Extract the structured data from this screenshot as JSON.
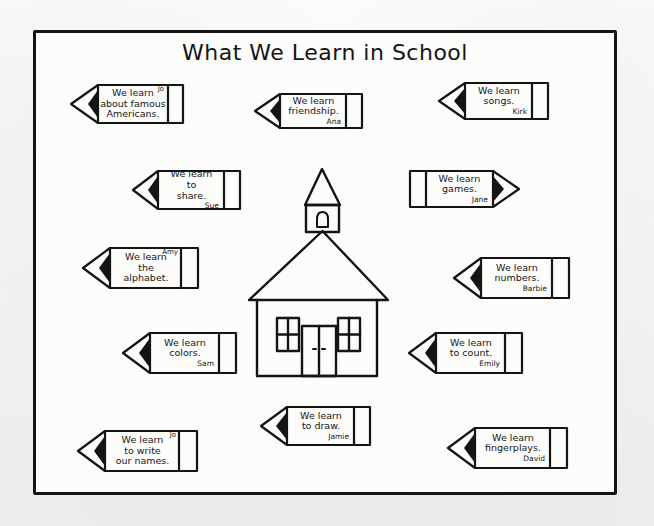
{
  "worksheet": {
    "title": "What We Learn in School",
    "background_color": "#f4f4f2",
    "ink_color": "#141414",
    "paper_color": "#fcfcfb"
  },
  "center_illustration": {
    "name": "schoolhouse",
    "parts": [
      "bell-tower",
      "bell",
      "roof",
      "window-left",
      "window-right",
      "double-door"
    ]
  },
  "pencils": [
    {
      "id": "pencil-famous-americans",
      "lines": [
        "We learn",
        "about famous",
        "Americans."
      ],
      "signature": "Jo",
      "signature_position": "top-right",
      "direction": "left"
    },
    {
      "id": "pencil-friendship",
      "lines": [
        "We learn",
        "friendship."
      ],
      "signature": "Ana",
      "signature_position": "bottom",
      "direction": "left"
    },
    {
      "id": "pencil-songs",
      "lines": [
        "We learn",
        "songs."
      ],
      "signature": "Kirk",
      "signature_position": "bottom",
      "direction": "left"
    },
    {
      "id": "pencil-share",
      "lines": [
        "We learn",
        "to",
        "share."
      ],
      "signature": "Sue",
      "signature_position": "bottom",
      "direction": "left"
    },
    {
      "id": "pencil-games",
      "lines": [
        "We learn",
        "games."
      ],
      "signature": "Jane",
      "signature_position": "bottom",
      "direction": "right"
    },
    {
      "id": "pencil-alphabet",
      "lines": [
        "We learn",
        "the",
        "alphabet."
      ],
      "signature": "Amy",
      "signature_position": "top-right",
      "direction": "left"
    },
    {
      "id": "pencil-numbers",
      "lines": [
        "We learn",
        "numbers."
      ],
      "signature": "Barbie",
      "signature_position": "bottom",
      "direction": "left"
    },
    {
      "id": "pencil-colors",
      "lines": [
        "We learn",
        "colors."
      ],
      "signature": "Sam",
      "signature_position": "bottom",
      "direction": "left"
    },
    {
      "id": "pencil-count",
      "lines": [
        "We learn",
        "to count."
      ],
      "signature": "Emily",
      "signature_position": "bottom",
      "direction": "left"
    },
    {
      "id": "pencil-write-names",
      "lines": [
        "We learn",
        "to write",
        "our names."
      ],
      "signature": "Jo",
      "signature_position": "top-right",
      "direction": "left"
    },
    {
      "id": "pencil-draw",
      "lines": [
        "We learn",
        "to draw."
      ],
      "signature": "Jamie",
      "signature_position": "bottom",
      "direction": "left"
    },
    {
      "id": "pencil-fingerplays",
      "lines": [
        "We learn",
        "fingerplays."
      ],
      "signature": "David",
      "signature_position": "bottom",
      "direction": "left"
    }
  ]
}
